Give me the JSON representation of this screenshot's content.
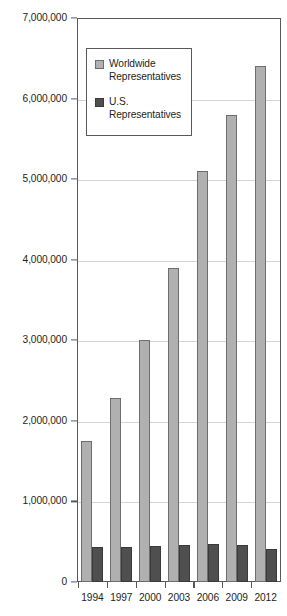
{
  "chart_data": {
    "type": "bar",
    "title": "",
    "subtitle": "",
    "xlabel": "",
    "ylabel": "",
    "categories": [
      "1994",
      "1997",
      "2000",
      "2003",
      "2006",
      "2009",
      "2012"
    ],
    "series": [
      {
        "name": "Worldwide Representatives",
        "color": "#b0b0b0",
        "values": [
          1750000,
          2290000,
          3000000,
          3900000,
          5100000,
          5800000,
          6400000
        ]
      },
      {
        "name": "U.S. Representatives",
        "color": "#4f4f4f",
        "values": [
          430000,
          440000,
          450000,
          460000,
          470000,
          460000,
          410000
        ]
      }
    ],
    "ylim": [
      0,
      7000000
    ],
    "ytick_values": [
      0,
      1000000,
      2000000,
      3000000,
      4000000,
      5000000,
      6000000,
      7000000
    ],
    "ytick_labels": [
      "0",
      "1,000,000",
      "2,000,000",
      "3,000,000",
      "4,000,000",
      "5,000,000",
      "6,000,000",
      "7,000,000"
    ],
    "grid": true,
    "grid_axis": "y",
    "legend_position": "upper-left-inside",
    "legend_entries": [
      {
        "label": "Worldwide Representatives",
        "color": "#b0b0b0"
      },
      {
        "label": "U.S. Representatives",
        "color": "#4f4f4f"
      }
    ]
  },
  "legend": {
    "entries": [
      {
        "line1": "Worldwide",
        "line2": "Representatives",
        "swatch": "worldwide-swatch"
      },
      {
        "line1": "U.S.",
        "line2": "Representatives",
        "swatch": "us-swatch"
      }
    ]
  },
  "colors": {
    "worldwide_fill": "#b0b0b0",
    "worldwide_edge": "#6e6e6e",
    "us_fill": "#4f4f4f",
    "us_edge": "#3a3a3a",
    "axis": "#58595b",
    "gridline": "#d4d4d4",
    "text": "#231f20",
    "background": "#ffffff"
  }
}
